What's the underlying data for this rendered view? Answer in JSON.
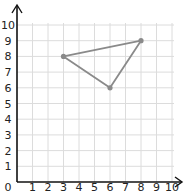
{
  "chart_data": {
    "type": "scatter",
    "title": "",
    "xlabel": "",
    "ylabel": "",
    "xlim": [
      0,
      10
    ],
    "ylim": [
      0,
      10
    ],
    "grid": true,
    "x_ticks": [
      "0",
      "1",
      "2",
      "3",
      "4",
      "5",
      "6",
      "7",
      "8",
      "9",
      "10"
    ],
    "y_ticks": [
      "1",
      "2",
      "3",
      "4",
      "5",
      "6",
      "7",
      "8",
      "9",
      "10"
    ],
    "series": [
      {
        "name": "triangle",
        "closed": true,
        "points": [
          {
            "x": 3,
            "y": 8
          },
          {
            "x": 8,
            "y": 9
          },
          {
            "x": 6,
            "y": 6
          }
        ]
      }
    ],
    "colors": {
      "shape": "#8a8a8a",
      "grid": "#dcdcdc",
      "axis": "#111111"
    }
  }
}
